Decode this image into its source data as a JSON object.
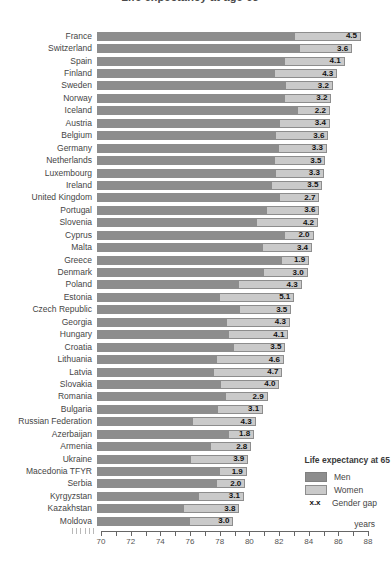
{
  "title_fragment": "Life expectancy at age 65",
  "colors": {
    "men_bar": "#8d8d8d",
    "women_bar": "#cacaca",
    "bar_border": "#8d8d8d",
    "axis": "#666666",
    "text": "#454545"
  },
  "chart_data": {
    "type": "bar",
    "orientation": "horizontal",
    "title": "Life expectancy at age 65",
    "xlabel": "years",
    "xlim": [
      70,
      88
    ],
    "x_ticklabels": [
      "70",
      "72",
      "74",
      "76",
      "78",
      "80",
      "82",
      "84",
      "86",
      "88"
    ],
    "minor_tick_step": 1,
    "axis_break_marks": 6,
    "grid": false,
    "legend": {
      "title": "Life expectancy at 65",
      "men_label": "Men",
      "women_label": "Women",
      "gap_symbol": "x.x",
      "gap_label": "Gender gap",
      "position": "bottom-right"
    },
    "series_names": [
      "Men",
      "Women"
    ],
    "rows": [
      {
        "country": "France",
        "men": 83.3,
        "women": 87.8,
        "gap": "4.5"
      },
      {
        "country": "Switzerland",
        "men": 83.6,
        "women": 87.2,
        "gap": "3.6"
      },
      {
        "country": "Spain",
        "men": 82.6,
        "women": 86.7,
        "gap": "4.1"
      },
      {
        "country": "Finland",
        "men": 81.9,
        "women": 86.2,
        "gap": "4.3"
      },
      {
        "country": "Sweden",
        "men": 82.7,
        "women": 85.9,
        "gap": "3.2"
      },
      {
        "country": "Norway",
        "men": 82.6,
        "women": 85.8,
        "gap": "3.2"
      },
      {
        "country": "Iceland",
        "men": 83.5,
        "women": 85.7,
        "gap": "2.2"
      },
      {
        "country": "Austria",
        "men": 82.3,
        "women": 85.7,
        "gap": "3.4"
      },
      {
        "country": "Belgium",
        "men": 82.0,
        "women": 85.6,
        "gap": "3.6"
      },
      {
        "country": "Germany",
        "men": 82.2,
        "women": 85.5,
        "gap": "3.3"
      },
      {
        "country": "Netherlands",
        "men": 81.9,
        "women": 85.4,
        "gap": "3.5"
      },
      {
        "country": "Luxembourg",
        "men": 82.0,
        "women": 85.3,
        "gap": "3.3"
      },
      {
        "country": "Ireland",
        "men": 81.7,
        "women": 85.2,
        "gap": "3.5"
      },
      {
        "country": "United Kingdom",
        "men": 82.3,
        "women": 85.0,
        "gap": "2.7"
      },
      {
        "country": "Portugal",
        "men": 81.4,
        "women": 85.0,
        "gap": "3.6"
      },
      {
        "country": "Slovenia",
        "men": 80.7,
        "women": 84.9,
        "gap": "4.2"
      },
      {
        "country": "Cyprus",
        "men": 82.6,
        "women": 84.6,
        "gap": "2.0"
      },
      {
        "country": "Malta",
        "men": 81.1,
        "women": 84.5,
        "gap": "3.4"
      },
      {
        "country": "Greece",
        "men": 82.4,
        "women": 84.3,
        "gap": "1.9"
      },
      {
        "country": "Denmark",
        "men": 81.2,
        "women": 84.2,
        "gap": "3.0"
      },
      {
        "country": "Poland",
        "men": 79.5,
        "women": 83.8,
        "gap": "4.3"
      },
      {
        "country": "Estonia",
        "men": 78.2,
        "women": 83.3,
        "gap": "5.1"
      },
      {
        "country": "Czech Republic",
        "men": 79.6,
        "women": 83.1,
        "gap": "3.5"
      },
      {
        "country": "Georgia",
        "men": 78.7,
        "women": 83.0,
        "gap": "4.3"
      },
      {
        "country": "Hungary",
        "men": 78.8,
        "women": 82.9,
        "gap": "4.1"
      },
      {
        "country": "Croatia",
        "men": 79.2,
        "women": 82.7,
        "gap": "3.5"
      },
      {
        "country": "Lithuania",
        "men": 78.0,
        "women": 82.6,
        "gap": "4.6"
      },
      {
        "country": "Latvia",
        "men": 77.8,
        "women": 82.5,
        "gap": "4.7"
      },
      {
        "country": "Slovakia",
        "men": 78.3,
        "women": 82.3,
        "gap": "4.0"
      },
      {
        "country": "Romania",
        "men": 78.6,
        "women": 81.5,
        "gap": "2.9"
      },
      {
        "country": "Bulgaria",
        "men": 78.1,
        "women": 81.2,
        "gap": "3.1"
      },
      {
        "country": "Russian Federation",
        "men": 76.4,
        "women": 80.7,
        "gap": "4.3"
      },
      {
        "country": "Azerbaijan",
        "men": 78.8,
        "women": 80.6,
        "gap": "1.8"
      },
      {
        "country": "Armenia",
        "men": 77.6,
        "women": 80.4,
        "gap": "2.8"
      },
      {
        "country": "Ukraine",
        "men": 76.3,
        "women": 80.2,
        "gap": "3.9"
      },
      {
        "country": "Macedonia TFYR",
        "men": 78.2,
        "women": 80.1,
        "gap": "1.9"
      },
      {
        "country": "Serbia",
        "men": 78.0,
        "women": 80.0,
        "gap": "2.0"
      },
      {
        "country": "Kyrgyzstan",
        "men": 76.8,
        "women": 79.9,
        "gap": "3.1"
      },
      {
        "country": "Kazakhstan",
        "men": 75.8,
        "women": 79.6,
        "gap": "3.8"
      },
      {
        "country": "Moldova",
        "men": 76.2,
        "women": 79.2,
        "gap": "3.0"
      }
    ]
  }
}
